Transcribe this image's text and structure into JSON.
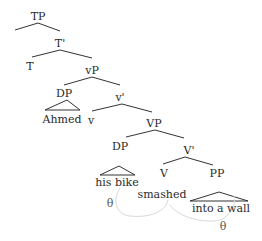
{
  "diagram": {
    "type": "syntax-tree",
    "nodes": {
      "tp": "TP",
      "t_bar": "T'",
      "t": "T",
      "vp_little": "vP",
      "dp_subject": "DP",
      "subject": "Ahmed",
      "v_little": "v",
      "v_bar_little": "v'",
      "vp": "VP",
      "dp_object": "DP",
      "object": "his bike",
      "v_bar": "V'",
      "v": "V",
      "verb": "smashed",
      "pp": "PP",
      "pp_text": "into a wall"
    },
    "theta_roles": {
      "object_theta": "θ",
      "pp_theta": "θ"
    },
    "edges": [
      [
        "TP",
        "left-spec"
      ],
      [
        "TP",
        "T'"
      ],
      [
        "T'",
        "T"
      ],
      [
        "T'",
        "vP"
      ],
      [
        "vP",
        "DP"
      ],
      [
        "vP",
        "v'"
      ],
      [
        "v'",
        "v"
      ],
      [
        "v'",
        "VP"
      ],
      [
        "VP",
        "DP"
      ],
      [
        "VP",
        "V'"
      ],
      [
        "V'",
        "V"
      ],
      [
        "V'",
        "PP"
      ]
    ]
  }
}
